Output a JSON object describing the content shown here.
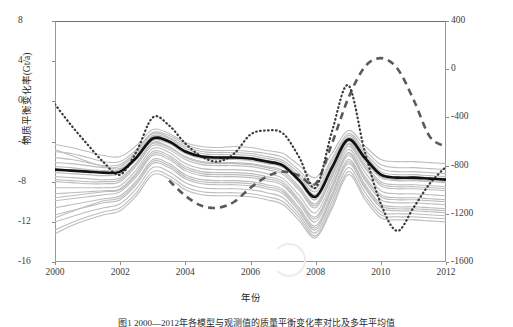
{
  "figure": {
    "xlabel": "年份",
    "ylabel_left": "物质平衡变化率(Gt/a)",
    "ylabel_right": "冰川物质平衡(mm/a)",
    "caption": "图1  2000—2012年各模型与观测值的质量平衡变化率对比及多年平均值"
  },
  "axes": {
    "x_ticks": [
      "2000",
      "2002",
      "2004",
      "2006",
      "2008",
      "2010",
      "2012"
    ],
    "y_ticks_left": [
      "8",
      "4",
      "0",
      "-4",
      "-8",
      "-12",
      "-16"
    ],
    "y_ticks_right": [
      "400",
      "0",
      "-400",
      "-800",
      "-1200",
      "-1600"
    ]
  },
  "chart_data": {
    "type": "line",
    "title": "",
    "xlabel": "年份",
    "ylabel": "物质平衡变化率(Gt/a)",
    "ylabel_secondary": "冰川物质平衡(mm/a)",
    "xlim": [
      2000,
      2012
    ],
    "ylim": [
      -16,
      8
    ],
    "ylim_secondary": [
      -1600,
      400
    ],
    "grid": false,
    "legend": "none",
    "x": [
      2000,
      2000.5,
      2001,
      2001.5,
      2002,
      2002.5,
      2003,
      2003.5,
      2004,
      2004.5,
      2005,
      2005.5,
      2006,
      2006.5,
      2007,
      2007.5,
      2008,
      2008.5,
      2009,
      2009.5,
      2010,
      2010.5,
      2011,
      2011.5,
      2012
    ],
    "series": [
      {
        "name": "多模型平均 (mean)",
        "style": "solid-black",
        "color": "#111111",
        "width": 2.6,
        "values": [
          -6.8,
          -6.9,
          -7.0,
          -7.1,
          -7.0,
          -5.6,
          -3.7,
          -4.0,
          -5.0,
          -5.5,
          -5.6,
          -5.6,
          -5.7,
          -6.0,
          -6.4,
          -7.9,
          -9.5,
          -6.6,
          -3.8,
          -5.6,
          -7.3,
          -7.6,
          -7.6,
          -7.7,
          -7.8
        ]
      },
      {
        "name": "观测值 (dotted)",
        "style": "dotted",
        "color": "#3a3a3a",
        "width": 2.2,
        "values": [
          -0.3,
          -2.4,
          -4.3,
          -6.1,
          -7.3,
          -5.0,
          -1.6,
          -2.4,
          -4.2,
          -5.5,
          -6.0,
          -5.2,
          -3.3,
          -2.9,
          -3.2,
          -5.6,
          -8.6,
          -3.0,
          1.6,
          -4.9,
          -10.2,
          -12.9,
          -10.6,
          -8.2,
          -6.5
        ]
      },
      {
        "name": "对比模型 (dashed)",
        "style": "dashed",
        "color": "#5a5a5a",
        "width": 2.6,
        "values": [
          null,
          null,
          null,
          null,
          null,
          null,
          null,
          -7.9,
          -9.4,
          -10.4,
          -10.6,
          -10.0,
          -8.6,
          -7.5,
          -7.0,
          -7.4,
          -8.2,
          -4.2,
          0.3,
          3.4,
          4.3,
          3.3,
          0.2,
          -3.5,
          -4.5
        ]
      },
      {
        "name": "模式成员集合 (ensemble, 20 runs)",
        "style": "thin-gray",
        "color": "#bdbdbd",
        "width": 1.1,
        "members": [
          {
            "values": [
              -4.3,
              -4.6,
              -5.0,
              -5.4,
              -5.5,
              -4.4,
              -2.8,
              -3.2,
              -4.1,
              -4.5,
              -4.6,
              -4.5,
              -4.6,
              -4.9,
              -5.2,
              -6.4,
              -7.6,
              -5.2,
              -2.9,
              -4.4,
              -5.8,
              -6.0,
              -6.0,
              -6.1,
              -6.2
            ]
          },
          {
            "values": [
              -5.0,
              -5.2,
              -5.6,
              -6.0,
              -6.0,
              -4.8,
              -3.1,
              -3.4,
              -4.3,
              -4.8,
              -4.9,
              -4.9,
              -5.0,
              -5.2,
              -5.6,
              -6.9,
              -8.3,
              -5.7,
              -3.2,
              -4.8,
              -6.3,
              -6.6,
              -6.6,
              -6.7,
              -6.8
            ]
          },
          {
            "values": [
              -5.6,
              -5.8,
              -6.1,
              -6.4,
              -6.3,
              -5.0,
              -3.2,
              -3.6,
              -4.5,
              -5.0,
              -5.1,
              -5.1,
              -5.2,
              -5.5,
              -5.9,
              -7.2,
              -8.7,
              -6.0,
              -3.4,
              -5.1,
              -6.7,
              -7.0,
              -7.0,
              -7.1,
              -7.2
            ]
          },
          {
            "values": [
              -6.1,
              -6.2,
              -6.4,
              -6.6,
              -6.5,
              -5.2,
              -3.4,
              -3.7,
              -4.7,
              -5.2,
              -5.3,
              -5.3,
              -5.4,
              -5.7,
              -6.1,
              -7.5,
              -9.0,
              -6.3,
              -3.6,
              -5.3,
              -7.0,
              -7.3,
              -7.3,
              -7.4,
              -7.5
            ]
          },
          {
            "values": [
              -6.5,
              -6.6,
              -6.8,
              -6.9,
              -6.8,
              -5.4,
              -3.5,
              -3.9,
              -4.9,
              -5.4,
              -5.5,
              -5.5,
              -5.6,
              -5.9,
              -6.3,
              -7.7,
              -9.3,
              -6.5,
              -3.7,
              -5.5,
              -7.2,
              -7.5,
              -7.5,
              -7.6,
              -7.7
            ]
          },
          {
            "values": [
              -7.1,
              -7.2,
              -7.3,
              -7.4,
              -7.2,
              -5.8,
              -3.9,
              -4.2,
              -5.2,
              -5.7,
              -5.8,
              -5.8,
              -5.9,
              -6.2,
              -6.6,
              -8.1,
              -9.8,
              -6.9,
              -4.0,
              -5.9,
              -7.6,
              -7.9,
              -7.9,
              -8.0,
              -8.1
            ]
          },
          {
            "values": [
              -7.5,
              -7.6,
              -7.7,
              -7.8,
              -7.6,
              -6.1,
              -4.1,
              -4.5,
              -5.5,
              -6.0,
              -6.1,
              -6.1,
              -6.2,
              -6.5,
              -6.9,
              -8.5,
              -10.2,
              -7.2,
              -4.2,
              -6.2,
              -8.0,
              -8.3,
              -8.3,
              -8.4,
              -8.5
            ]
          },
          {
            "values": [
              -8.0,
              -8.1,
              -8.2,
              -8.2,
              -8.0,
              -6.4,
              -4.4,
              -4.8,
              -5.8,
              -6.3,
              -6.4,
              -6.4,
              -6.5,
              -6.8,
              -7.3,
              -8.9,
              -10.6,
              -7.6,
              -4.5,
              -6.6,
              -8.4,
              -8.7,
              -8.7,
              -8.8,
              -8.9
            ]
          },
          {
            "values": [
              -8.6,
              -8.6,
              -8.6,
              -8.6,
              -8.4,
              -6.8,
              -4.7,
              -5.1,
              -6.2,
              -6.7,
              -6.8,
              -6.8,
              -6.9,
              -7.2,
              -7.7,
              -9.4,
              -11.1,
              -8.0,
              -4.8,
              -7.0,
              -8.9,
              -9.2,
              -9.2,
              -9.3,
              -9.4
            ]
          },
          {
            "values": [
              -9.2,
              -9.1,
              -9.0,
              -8.9,
              -8.7,
              -7.1,
              -5.0,
              -5.4,
              -6.5,
              -7.0,
              -7.1,
              -7.1,
              -7.2,
              -7.5,
              -8.0,
              -9.8,
              -11.5,
              -8.4,
              -5.1,
              -7.4,
              -9.3,
              -9.6,
              -9.6,
              -9.7,
              -9.8
            ]
          },
          {
            "values": [
              -9.9,
              -9.7,
              -9.5,
              -9.3,
              -9.0,
              -7.5,
              -5.4,
              -5.8,
              -6.9,
              -7.4,
              -7.5,
              -7.5,
              -7.6,
              -7.9,
              -8.4,
              -10.2,
              -12.0,
              -8.8,
              -5.4,
              -7.8,
              -9.8,
              -10.1,
              -10.1,
              -10.2,
              -10.3
            ]
          },
          {
            "values": [
              -10.6,
              -10.3,
              -10.0,
              -9.7,
              -9.4,
              -7.9,
              -5.8,
              -6.2,
              -7.3,
              -7.8,
              -7.9,
              -7.9,
              -8.0,
              -8.3,
              -8.8,
              -10.6,
              -12.4,
              -9.2,
              -5.8,
              -8.2,
              -10.2,
              -10.5,
              -10.5,
              -10.6,
              -10.7
            ]
          },
          {
            "values": [
              -11.3,
              -10.9,
              -10.5,
              -10.1,
              -9.8,
              -8.3,
              -6.2,
              -6.6,
              -7.7,
              -8.2,
              -8.3,
              -8.3,
              -8.4,
              -8.7,
              -9.2,
              -11.0,
              -12.8,
              -9.6,
              -6.2,
              -8.6,
              -10.6,
              -10.9,
              -10.9,
              -11.0,
              -11.1
            ]
          },
          {
            "values": [
              -12.0,
              -11.5,
              -11.0,
              -10.6,
              -10.2,
              -8.7,
              -6.6,
              -7.0,
              -8.1,
              -8.6,
              -8.7,
              -8.7,
              -8.8,
              -9.1,
              -9.6,
              -11.3,
              -13.1,
              -10.0,
              -6.6,
              -9.0,
              -11.0,
              -11.2,
              -11.2,
              -11.3,
              -11.4
            ]
          },
          {
            "values": [
              -12.8,
              -12.1,
              -11.5,
              -11.0,
              -10.6,
              -9.1,
              -7.0,
              -7.4,
              -8.5,
              -9.0,
              -9.1,
              -9.1,
              -9.2,
              -9.5,
              -10.0,
              -11.6,
              -13.4,
              -10.4,
              -7.0,
              -9.4,
              -11.3,
              -11.5,
              -11.5,
              -11.6,
              -11.7
            ]
          },
          {
            "values": [
              -4.8,
              -5.4,
              -6.0,
              -6.5,
              -6.7,
              -5.5,
              -3.8,
              -4.1,
              -5.1,
              -5.6,
              -5.7,
              -5.7,
              -5.8,
              -6.1,
              -6.5,
              -8.0,
              -9.6,
              -6.8,
              -3.9,
              -5.8,
              -7.5,
              -7.8,
              -7.8,
              -7.9,
              -8.0
            ]
          },
          {
            "values": [
              -9.6,
              -9.4,
              -9.2,
              -9.0,
              -8.8,
              -7.3,
              -5.2,
              -5.6,
              -6.7,
              -7.2,
              -7.3,
              -7.3,
              -7.4,
              -7.7,
              -8.2,
              -10.0,
              -11.7,
              -8.6,
              -5.2,
              -7.6,
              -9.5,
              -9.8,
              -9.8,
              -9.9,
              -10.0
            ]
          },
          {
            "values": [
              -11.6,
              -11.0,
              -10.4,
              -9.9,
              -9.6,
              -8.1,
              -6.0,
              -6.4,
              -7.5,
              -8.0,
              -8.1,
              -8.1,
              -8.2,
              -8.5,
              -9.0,
              -10.8,
              -12.6,
              -9.4,
              -6.0,
              -8.4,
              -10.4,
              -10.7,
              -10.7,
              -10.8,
              -10.9
            ]
          },
          {
            "values": [
              -7.8,
              -7.9,
              -8.0,
              -8.0,
              -7.8,
              -6.2,
              -4.2,
              -4.6,
              -5.6,
              -6.1,
              -6.2,
              -6.2,
              -6.3,
              -6.6,
              -7.1,
              -8.7,
              -10.4,
              -7.4,
              -4.3,
              -6.4,
              -8.2,
              -8.5,
              -8.5,
              -8.6,
              -8.7
            ]
          },
          {
            "values": [
              -13.2,
              -12.4,
              -11.8,
              -11.3,
              -10.9,
              -9.4,
              -7.3,
              -7.7,
              -8.8,
              -9.3,
              -9.4,
              -9.4,
              -9.5,
              -9.8,
              -10.3,
              -11.9,
              -13.6,
              -10.7,
              -7.3,
              -9.7,
              -11.6,
              -11.8,
              -11.8,
              -11.9,
              -12.0
            ]
          }
        ]
      }
    ]
  }
}
